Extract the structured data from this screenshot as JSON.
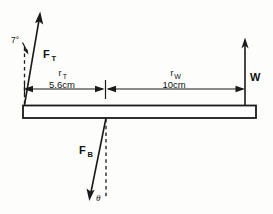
{
  "diagram": {
    "type": "free-body-diagram",
    "title": "",
    "background_color": "#fdfdfc",
    "ink_color": "#1a1a1a",
    "beam": {
      "name": "horizontal-beam",
      "x_left": 23,
      "x_right": 256,
      "y_top": 105,
      "y_bottom": 118
    },
    "forces": [
      {
        "id": "tension",
        "label": "F",
        "subscript": "T",
        "direction": "up-right",
        "origin": {
          "x": 24,
          "y": 105
        },
        "tip": {
          "x": 40,
          "y": 12
        },
        "angle_label": "7°",
        "angle_reference": "vertical-dashed"
      },
      {
        "id": "weight",
        "label": "W",
        "subscript": "",
        "direction": "up",
        "origin": {
          "x": 245,
          "y": 105
        },
        "tip": {
          "x": 245,
          "y": 38
        },
        "angle_label": "",
        "angle_reference": ""
      },
      {
        "id": "bone-reaction",
        "label": "F",
        "subscript": "B",
        "direction": "down-left",
        "origin": {
          "x": 106,
          "y": 118
        },
        "tip": {
          "x": 89,
          "y": 201
        },
        "angle_label": "θ",
        "angle_reference": "vertical-dashed"
      }
    ],
    "dimensions": [
      {
        "id": "r-tension",
        "symbol": "r",
        "subscript": "T",
        "value": "5.6cm",
        "x_start": 24,
        "x_end": 105,
        "y": 89
      },
      {
        "id": "r-weight",
        "symbol": "r",
        "subscript": "W",
        "value": "10cm",
        "x_start": 106,
        "x_end": 245,
        "y": 89
      }
    ],
    "tick_mark": {
      "id": "pivot-tick",
      "x": 105,
      "y_top": 80,
      "y_bottom": 99
    }
  }
}
